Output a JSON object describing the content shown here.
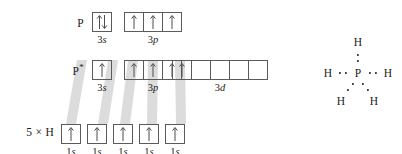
{
  "figure": {
    "background_color": "#ffffff",
    "box_border_color": "#5a5a5a",
    "arrow_color": "#4d4d4d",
    "band_color": "#d8d8d8"
  },
  "rows": [
    {
      "id": "ground-state",
      "label": "P",
      "label_star": "",
      "groups": [
        {
          "id": "3s",
          "sublabel_n": "3",
          "sublabel_l": "s",
          "boxes": [
            {
              "spin": "updown"
            }
          ]
        },
        {
          "id": "3p",
          "sublabel_n": "3",
          "sublabel_l": "p",
          "boxes": [
            {
              "spin": "up"
            },
            {
              "spin": "up"
            },
            {
              "spin": "up"
            }
          ]
        }
      ]
    },
    {
      "id": "excited-state",
      "label": "P",
      "label_star": "*",
      "groups": [
        {
          "id": "3s",
          "sublabel_n": "3",
          "sublabel_l": "s",
          "boxes": [
            {
              "spin": "up"
            }
          ]
        },
        {
          "id": "3p",
          "sublabel_n": "3",
          "sublabel_l": "p",
          "boxes": [
            {
              "spin": "up"
            },
            {
              "spin": "up"
            },
            {
              "spin": "up"
            }
          ]
        },
        {
          "id": "3d",
          "sublabel_n": "3",
          "sublabel_l": "d",
          "boxes": [
            {
              "spin": "up"
            },
            {
              "spin": ""
            },
            {
              "spin": ""
            },
            {
              "spin": ""
            },
            {
              "spin": ""
            }
          ]
        }
      ]
    },
    {
      "id": "hydrogens",
      "label": "5 × H",
      "label_star": "",
      "groups": [
        {
          "id": "1s-a",
          "sublabel_n": "1",
          "sublabel_l": "s",
          "boxes": [
            {
              "spin": "up"
            }
          ]
        },
        {
          "id": "1s-b",
          "sublabel_n": "1",
          "sublabel_l": "s",
          "boxes": [
            {
              "spin": "up"
            }
          ]
        },
        {
          "id": "1s-c",
          "sublabel_n": "1",
          "sublabel_l": "s",
          "boxes": [
            {
              "spin": "up"
            }
          ]
        },
        {
          "id": "1s-d",
          "sublabel_n": "1",
          "sublabel_l": "s",
          "boxes": [
            {
              "spin": "up"
            }
          ]
        },
        {
          "id": "1s-e",
          "sublabel_n": "1",
          "sublabel_l": "s",
          "boxes": [
            {
              "spin": "up"
            }
          ]
        }
      ]
    }
  ],
  "lewis": {
    "center_atom": "P",
    "ligands": [
      {
        "id": "h-top",
        "symbol": "H"
      },
      {
        "id": "h-left",
        "symbol": "H"
      },
      {
        "id": "h-right",
        "symbol": "H"
      },
      {
        "id": "h-bottom-left",
        "symbol": "H"
      },
      {
        "id": "h-bottom-right",
        "symbol": "H"
      }
    ],
    "bond_electron_pairs": 5
  }
}
